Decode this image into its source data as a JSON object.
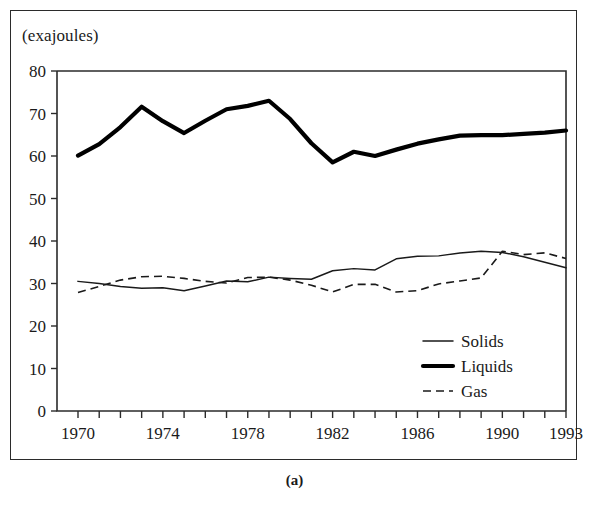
{
  "figure": {
    "caption": "(a)",
    "unit_label": "(exajoules)"
  },
  "chart_data": {
    "type": "line",
    "title": "",
    "subtitle": "",
    "xlabel": "",
    "ylabel": "(exajoules)",
    "xlim": [
      1970,
      1993
    ],
    "ylim": [
      0,
      80
    ],
    "grid": false,
    "legend_position": "inside-lower-right",
    "y_ticks": [
      0,
      10,
      20,
      30,
      40,
      50,
      60,
      70,
      80
    ],
    "y_tick_labels": [
      "0",
      "10",
      "20",
      "30",
      "40",
      "50",
      "60",
      "70",
      "80"
    ],
    "x_ticks": [
      1970,
      1971,
      1972,
      1973,
      1974,
      1975,
      1976,
      1977,
      1978,
      1979,
      1980,
      1981,
      1982,
      1983,
      1984,
      1985,
      1986,
      1987,
      1988,
      1989,
      1990,
      1991,
      1992,
      1993
    ],
    "x_tick_labels_shown": [
      "1970",
      "1974",
      "1978",
      "1982",
      "1986",
      "1990",
      "1993"
    ],
    "x": [
      1970,
      1971,
      1972,
      1973,
      1974,
      1975,
      1976,
      1977,
      1978,
      1979,
      1980,
      1981,
      1982,
      1983,
      1984,
      1985,
      1986,
      1987,
      1988,
      1989,
      1990,
      1991,
      1992,
      1993
    ],
    "series": [
      {
        "name": "Solids",
        "style": "solid-thin",
        "values": [
          30.5,
          30.0,
          29.3,
          28.9,
          29.0,
          28.3,
          29.4,
          30.6,
          30.4,
          31.5,
          31.2,
          31.0,
          33.0,
          33.5,
          33.2,
          35.8,
          36.4,
          36.5,
          37.2,
          37.6,
          37.3,
          36.3,
          35.0,
          33.7
        ]
      },
      {
        "name": "Liquids",
        "style": "solid-thick",
        "values": [
          60.1,
          62.8,
          66.8,
          71.6,
          68.2,
          65.4,
          68.3,
          71.0,
          71.8,
          73.0,
          68.7,
          63.0,
          58.5,
          61.0,
          60.0,
          61.5,
          62.9,
          63.9,
          64.8,
          64.9,
          64.9,
          65.2,
          65.5,
          66.0
        ]
      },
      {
        "name": "Gas",
        "style": "dashed",
        "values": [
          27.9,
          29.3,
          30.8,
          31.6,
          31.7,
          31.2,
          30.5,
          30.1,
          31.4,
          31.5,
          30.8,
          29.6,
          28.0,
          29.8,
          29.8,
          28.0,
          28.3,
          29.9,
          30.6,
          31.3,
          37.6,
          36.8,
          37.2,
          35.9
        ]
      }
    ]
  },
  "legend": {
    "items": [
      {
        "label": "Solids",
        "style": "solid-thin"
      },
      {
        "label": "Liquids",
        "style": "solid-thick"
      },
      {
        "label": "Gas",
        "style": "dashed"
      }
    ]
  }
}
